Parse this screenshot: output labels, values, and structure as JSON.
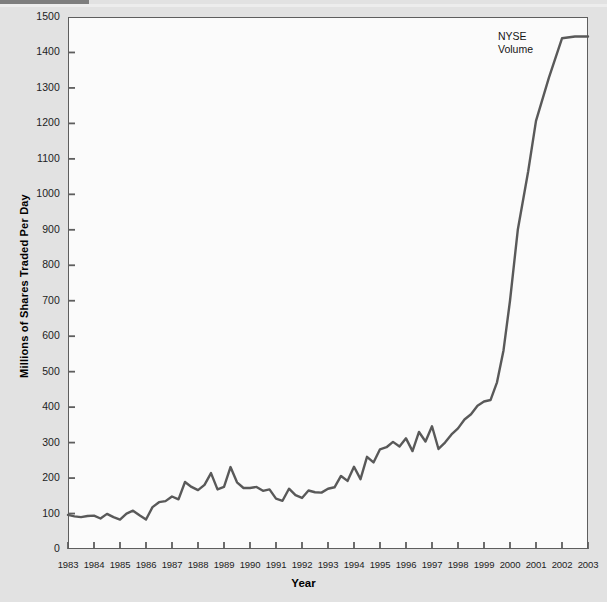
{
  "chart_data": {
    "type": "line",
    "title": "",
    "subtitle": "",
    "xlabel": "Year",
    "ylabel": "Millions of Shares Traded Per Day",
    "xlim": [
      1983,
      2003
    ],
    "ylim": [
      0,
      1500
    ],
    "grid": false,
    "legend_position": "inline-annotation",
    "annotations": [
      {
        "text": "NYSE\nVolume",
        "x": 2000.1,
        "y": 1432
      }
    ],
    "ytick_labels": [
      "0",
      "100",
      "200",
      "300",
      "400",
      "500",
      "600",
      "700",
      "800",
      "900",
      "1000",
      "1100",
      "1200",
      "1300",
      "1400",
      "1500"
    ],
    "ytick_values": [
      0,
      100,
      200,
      300,
      400,
      500,
      600,
      700,
      800,
      900,
      1000,
      1100,
      1200,
      1300,
      1400,
      1500
    ],
    "xtick_labels": [
      "1983",
      "1984",
      "1985",
      "1986",
      "1987",
      "1988",
      "1989",
      "1990",
      "1991",
      "1992",
      "1993",
      "1994",
      "1995",
      "1996",
      "1997",
      "1998",
      "1999",
      "2000",
      "2001",
      "2002",
      "2003"
    ],
    "xtick_values": [
      1983,
      1984,
      1985,
      1986,
      1987,
      1988,
      1989,
      1990,
      1991,
      1992,
      1993,
      1994,
      1995,
      1996,
      1997,
      1998,
      1999,
      2000,
      2001,
      2002,
      2003
    ],
    "series": [
      {
        "name": "NYSE Volume",
        "color": "#595959",
        "line_width": 2.4,
        "x": [
          1983.0,
          1983.25,
          1983.5,
          1983.75,
          1984.0,
          1984.25,
          1984.5,
          1984.75,
          1985.0,
          1985.25,
          1985.5,
          1985.75,
          1986.0,
          1986.25,
          1986.5,
          1986.75,
          1987.0,
          1987.25,
          1987.5,
          1987.75,
          1988.0,
          1988.25,
          1988.5,
          1988.75,
          1989.0,
          1989.25,
          1989.5,
          1989.75,
          1990.0,
          1990.25,
          1990.5,
          1990.75,
          1991.0,
          1991.25,
          1991.5,
          1991.75,
          1992.0,
          1992.25,
          1992.5,
          1992.75,
          1993.0,
          1993.25,
          1993.5,
          1993.75,
          1994.0,
          1994.25,
          1994.5,
          1994.75,
          1995.0,
          1995.25,
          1995.5,
          1995.75,
          1996.0,
          1996.25,
          1996.5,
          1996.75,
          1997.0,
          1997.25,
          1997.5,
          1997.75,
          1998.0,
          1998.25,
          1998.5,
          1998.75,
          1999.0,
          1999.25,
          1999.5,
          1999.75,
          2000.0,
          2000.3,
          2000.7,
          2001.0,
          2001.5,
          2002.0,
          2002.5,
          2003.0
        ],
        "y": [
          96,
          92,
          90,
          93,
          94,
          86,
          99,
          90,
          83,
          100,
          108,
          95,
          83,
          118,
          132,
          135,
          148,
          140,
          189,
          175,
          166,
          181,
          214,
          168,
          175,
          231,
          188,
          172,
          172,
          175,
          164,
          168,
          142,
          136,
          170,
          152,
          144,
          165,
          160,
          159,
          170,
          174,
          206,
          192,
          232,
          197,
          260,
          244,
          281,
          287,
          302,
          289,
          312,
          276,
          330,
          303,
          346,
          282,
          300,
          323,
          340,
          365,
          380,
          404,
          416,
          420,
          470,
          560,
          700,
          900,
          1065,
          1207,
          1330,
          1440,
          1445,
          1445
        ]
      }
    ]
  },
  "axes": {
    "plot_left_px": 68,
    "plot_top_px": 17,
    "plot_width_px": 520,
    "plot_height_px": 532
  },
  "colors": {
    "page_background": "#e2e2e2",
    "plot_background": "#fbfbfb",
    "frame": "#5e5e5e",
    "line": "#595959",
    "text": "#1d1d1d"
  }
}
